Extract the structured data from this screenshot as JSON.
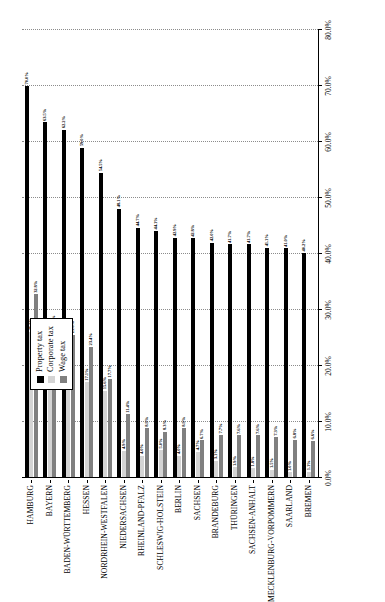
{
  "chart_data": {
    "type": "bar",
    "orientation": "vertical-rotated",
    "title": "",
    "subtitle": "",
    "xlabel": "",
    "ylabel": "",
    "ylim": [
      0,
      80
    ],
    "grid": true,
    "legend_position": "top-center",
    "tick_labels": [
      "0.0%",
      "10.0%",
      "20.0%",
      "30.0%",
      "40.0%",
      "50.0%",
      "60.0%",
      "70.0%",
      "80.0%"
    ],
    "tick_values": [
      0,
      10,
      20,
      30,
      40,
      50,
      60,
      70,
      80
    ],
    "categories": [
      "HAMBURG",
      "BAYERN",
      "BADEN-WÜRTTEMBERG",
      "HESSEN",
      "NORDRHEIN-WESTFALEN",
      "NIEDERSACHSEN",
      "RHEINLAND-PFALZ",
      "SCHLESWIG-HOLSTEIN",
      "BERLIN",
      "SACHSEN",
      "BRANDEBURG",
      "THÜRINGEN",
      "SACHSEN-ANHALT",
      "MECKLENBURG-VORPOMMERN",
      "SAARLAND",
      "BREMEN"
    ],
    "series": [
      {
        "name": "Property tax",
        "color": "#000000",
        "values": [
          70.0,
          63.5,
          62.2,
          59.0,
          54.5,
          48.1,
          44.7,
          44.1,
          42.9,
          42.8,
          42.0,
          41.7,
          41.7,
          41.1,
          41.0,
          40.2
        ],
        "labels": [
          "70.0%",
          "63.5%",
          "62.2%",
          "59.0%",
          "54.5%",
          "48.1%",
          "44.7%",
          "44.1%",
          "42.9%",
          "42.8%",
          "42.0%",
          "41.7%",
          "41.7%",
          "41.1%",
          "41.0%",
          "40.2%"
        ]
      },
      {
        "name": "Corporate tax",
        "color": "#d4d4d4",
        "values": [
          26.1,
          20.0,
          18.1,
          17.1,
          15.6,
          4.9,
          4.0,
          5.0,
          4.0,
          4.7,
          3.1,
          1.9,
          1.8,
          1.5,
          1.0,
          1.1
        ],
        "labels": [
          "26.1%",
          "20.0%",
          "18.1%",
          "17.1%",
          "15.6%",
          "4.9%",
          "4.0%",
          "5.0%",
          "4.0%",
          "4.7%",
          "3.1%",
          "1.9%",
          "1.8%",
          "1.5%",
          "1.0%",
          "1.1%"
        ]
      },
      {
        "name": "Wage tax",
        "color": "#808080",
        "values": [
          32.8,
          26.6,
          25.6,
          23.4,
          17.7,
          11.4,
          8.9,
          8.3,
          8.9,
          6.7,
          7.7,
          7.6,
          7.6,
          7.3,
          6.8,
          6.6
        ],
        "labels": [
          "32.8%",
          "26.6%",
          "25.6%",
          "23.4%",
          "17.7%",
          "11.4%",
          "8.9%",
          "8.3%",
          "8.9%",
          "6.7%",
          "7.7%",
          "7.6%",
          "7.6%",
          "7.3%",
          "6.8%",
          "6.6%"
        ]
      }
    ]
  },
  "legend": {
    "items": [
      {
        "label": "Property tax",
        "swatch": "series-property"
      },
      {
        "label": "Corporate tax",
        "swatch": "series-corporate"
      },
      {
        "label": "Wage tax",
        "swatch": "series-wage"
      }
    ]
  }
}
